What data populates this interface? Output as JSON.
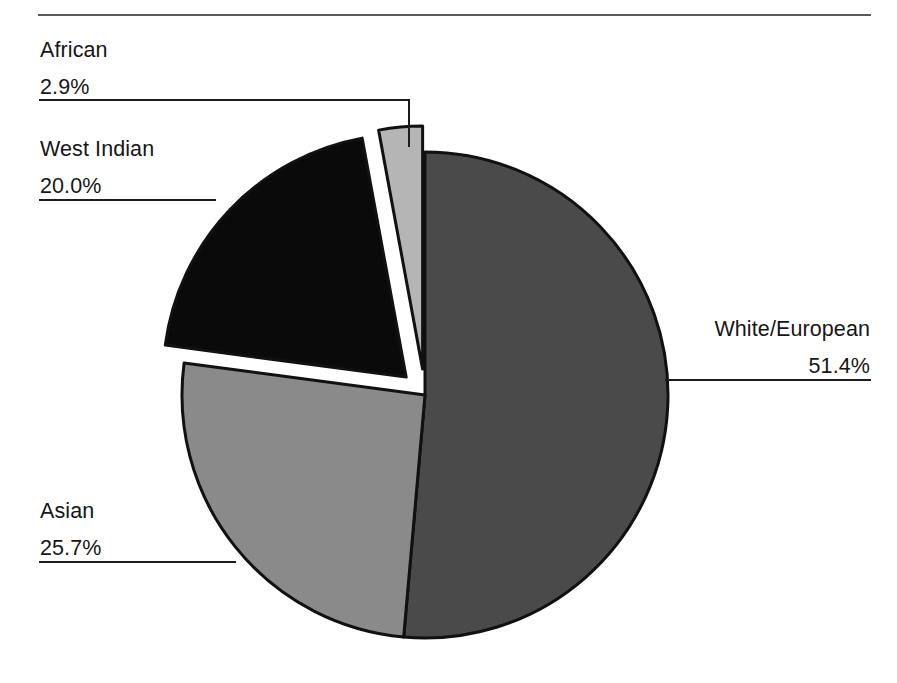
{
  "chart_data": {
    "type": "pie",
    "title": "",
    "units": "percent",
    "start_angle_deg": 0,
    "direction": "clockwise",
    "categories": [
      "White/European",
      "Asian",
      "West Indian",
      "African"
    ],
    "values": [
      51.4,
      25.7,
      20.0,
      2.9
    ],
    "labels": [
      "51.4%",
      "25.7%",
      "20.0%",
      "2.9%"
    ],
    "colors": [
      "#4a4a4a",
      "#8a8a8a",
      "#0a0a0a",
      "#b5b5b5"
    ],
    "exploded": [
      false,
      false,
      true,
      true
    ],
    "legend_position": "none",
    "grid": false,
    "slices": [
      {
        "name": "White/European",
        "value": 51.4,
        "label": "51.4%",
        "color": "#4a4a4a",
        "exploded": false
      },
      {
        "name": "Asian",
        "value": 25.7,
        "label": "25.7%",
        "color": "#8a8a8a",
        "exploded": false
      },
      {
        "name": "West Indian",
        "value": 20.0,
        "label": "20.0%",
        "color": "#0a0a0a",
        "exploded": true
      },
      {
        "name": "African",
        "value": 2.9,
        "label": "2.9%",
        "color": "#b5b5b5",
        "exploded": true
      }
    ]
  },
  "callouts": {
    "african": {
      "name": "African",
      "value": "2.9%"
    },
    "west_indian": {
      "name": "West Indian",
      "value": "20.0%"
    },
    "asian": {
      "name": "Asian",
      "value": "25.7%"
    },
    "white": {
      "name": "White/European",
      "value": "51.4%"
    }
  },
  "style": {
    "rule_color": "#5a5a5a",
    "leader_color": "#1c1c1c",
    "outline_color": "#111111",
    "background": "#ffffff",
    "text_color": "#161616"
  }
}
